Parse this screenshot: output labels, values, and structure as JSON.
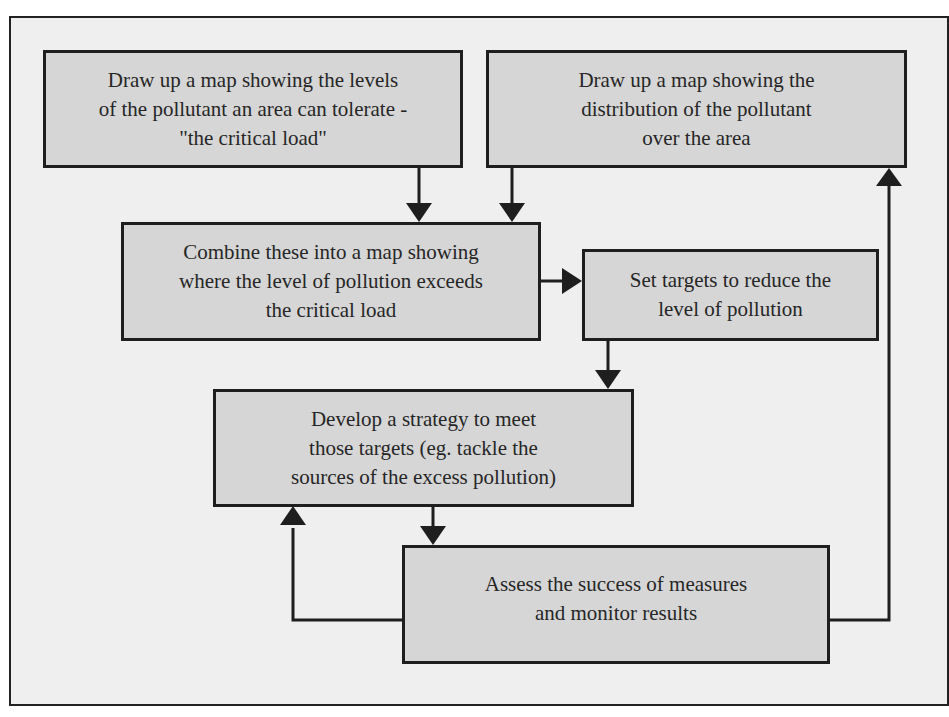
{
  "diagram": {
    "type": "flowchart",
    "colors": {
      "frame_bg": "#efefef",
      "box_bg": "#d6d6d6",
      "line": "#1e1e1e",
      "text": "#262626"
    },
    "nodes": [
      {
        "id": "critical-load-map",
        "lines": [
          "Draw up a map showing the levels",
          "of the pollutant an area can tolerate -",
          "\"the critical load\""
        ]
      },
      {
        "id": "distribution-map",
        "lines": [
          "Draw up a map showing the",
          "distribution of the pollutant",
          "over the area"
        ]
      },
      {
        "id": "combine-maps",
        "lines": [
          "Combine these into a map showing",
          "where the level of pollution exceeds",
          "the critical load"
        ]
      },
      {
        "id": "set-targets",
        "lines": [
          "Set targets to reduce the",
          "level of pollution"
        ]
      },
      {
        "id": "develop-strategy",
        "lines": [
          "Develop a strategy to meet",
          "those targets (eg. tackle the",
          "sources of the excess pollution)"
        ]
      },
      {
        "id": "assess-monitor",
        "lines": [
          "Assess the success of measures",
          "and monitor results"
        ]
      }
    ],
    "edges": [
      {
        "from": "critical-load-map",
        "to": "combine-maps"
      },
      {
        "from": "distribution-map",
        "to": "combine-maps"
      },
      {
        "from": "combine-maps",
        "to": "set-targets"
      },
      {
        "from": "set-targets",
        "to": "develop-strategy"
      },
      {
        "from": "develop-strategy",
        "to": "assess-monitor"
      },
      {
        "from": "assess-monitor",
        "to": "develop-strategy"
      },
      {
        "from": "assess-monitor",
        "to": "distribution-map"
      }
    ]
  }
}
